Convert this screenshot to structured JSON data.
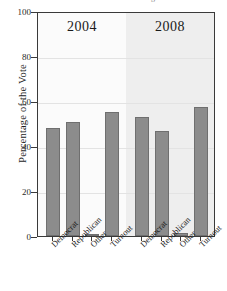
{
  "chart_data": {
    "type": "bar",
    "title": "",
    "caption_sliver": "g",
    "xlabel": "",
    "ylabel": "Percentage of the Vote",
    "ylim": [
      0,
      100
    ],
    "yticks": [
      0,
      20,
      40,
      60,
      80,
      100
    ],
    "ytick_labels": [
      "0",
      "20",
      "40",
      "60",
      "80",
      "100"
    ],
    "grid": true,
    "legend": "none",
    "categories": [
      "Democrat",
      "Republican",
      "Other",
      "Turnout"
    ],
    "panels": [
      {
        "label": "2004",
        "categories": [
          "Democrat",
          "Republican",
          "Other",
          "Turnout"
        ],
        "values": [
          48.0,
          50.7,
          1.0,
          55.3
        ]
      },
      {
        "label": "2008",
        "categories": [
          "Democrat",
          "Republican",
          "Other",
          "Turnout"
        ],
        "values": [
          53.0,
          46.7,
          1.2,
          57.5
        ]
      }
    ],
    "bar_color": "#8c8c8c",
    "bar_edge_color": "#6f6f6f",
    "panel_2008_background": "#eeeeee",
    "axis_color": "#3a3a3a"
  }
}
